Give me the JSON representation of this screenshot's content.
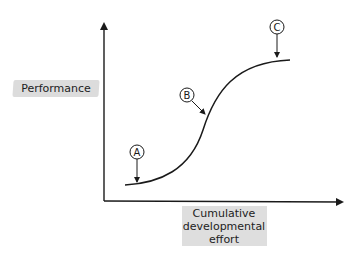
{
  "diagram": {
    "type": "s-curve",
    "y_axis_label": "Performance",
    "x_axis_label": "Cumulative\ndevelopmental\neffort",
    "markers": [
      {
        "id": "A",
        "label": "A"
      },
      {
        "id": "B",
        "label": "B"
      },
      {
        "id": "C",
        "label": "C"
      }
    ],
    "colors": {
      "line": "#1a1a1a",
      "label_background": "#d9d9d9",
      "background": "#ffffff"
    }
  }
}
